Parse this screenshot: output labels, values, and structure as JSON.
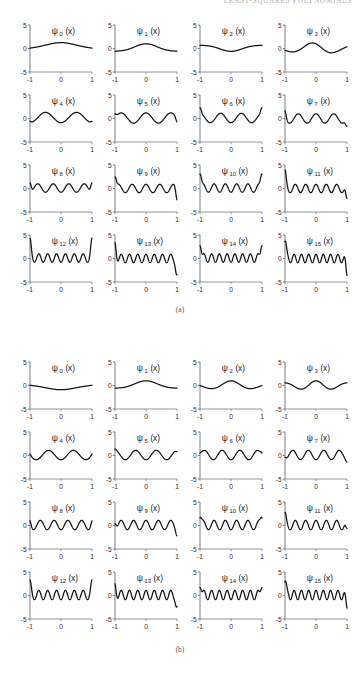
{
  "running_header": {
    "text": "Least-Squares Polynomials"
  },
  "axes": {
    "x_ticks": [
      "-1",
      "0",
      "1"
    ],
    "y_ticks": [
      "5",
      "0",
      "-5"
    ],
    "x_range": [
      -1,
      1
    ],
    "y_range": [
      -5,
      5
    ]
  },
  "figures": [
    {
      "id": "a",
      "caption": "(a)",
      "panel_labels": [
        "ψ",
        "ψ",
        "ψ",
        "ψ",
        "ψ",
        "ψ",
        "ψ",
        "ψ",
        "ψ",
        "ψ",
        "ψ",
        "ψ",
        "ψ",
        "ψ",
        "ψ",
        "ψ"
      ],
      "panels": [
        {
          "label_base": "ψ",
          "label_sub": "0",
          "label_arg": "(x)"
        },
        {
          "label_base": "ψ",
          "label_sub": "1",
          "label_arg": "(x)"
        },
        {
          "label_base": "ψ",
          "label_sub": "2",
          "label_arg": "(x)"
        },
        {
          "label_base": "ψ",
          "label_sub": "3",
          "label_arg": "(x)"
        },
        {
          "label_base": "ψ",
          "label_sub": "4",
          "label_arg": "(x)"
        },
        {
          "label_base": "ψ",
          "label_sub": "5",
          "label_arg": "(x)"
        },
        {
          "label_base": "ψ",
          "label_sub": "6",
          "label_arg": "(x)"
        },
        {
          "label_base": "ψ",
          "label_sub": "7",
          "label_arg": "(x)"
        },
        {
          "label_base": "ψ",
          "label_sub": "8",
          "label_arg": "(x)"
        },
        {
          "label_base": "ψ",
          "label_sub": "9",
          "label_arg": "(x)"
        },
        {
          "label_base": "ψ",
          "label_sub": "10",
          "label_arg": "(x)"
        },
        {
          "label_base": "ψ",
          "label_sub": "11",
          "label_arg": "(x)"
        },
        {
          "label_base": "ψ",
          "label_sub": "12",
          "label_arg": "(x)"
        },
        {
          "label_base": "ψ",
          "label_sub": "13",
          "label_arg": "(x)"
        },
        {
          "label_base": "ψ",
          "label_sub": "14",
          "label_arg": "(x)"
        },
        {
          "label_base": "ψ",
          "label_sub": "15",
          "label_arg": "(x)"
        }
      ]
    },
    {
      "id": "b",
      "caption": "(b)",
      "panels": [
        {
          "label_base": "ψ",
          "label_sub": "0",
          "label_arg": "(x)"
        },
        {
          "label_base": "ψ",
          "label_sub": "1",
          "label_arg": "(x)"
        },
        {
          "label_base": "ψ",
          "label_sub": "2",
          "label_arg": "(x)"
        },
        {
          "label_base": "ψ",
          "label_sub": "3",
          "label_arg": "(x)"
        },
        {
          "label_base": "ψ",
          "label_sub": "4",
          "label_arg": "(x)"
        },
        {
          "label_base": "ψ",
          "label_sub": "5",
          "label_arg": "(x)"
        },
        {
          "label_base": "ψ",
          "label_sub": "6",
          "label_arg": "(x)"
        },
        {
          "label_base": "ψ",
          "label_sub": "7",
          "label_arg": "(x)"
        },
        {
          "label_base": "ψ",
          "label_sub": "8",
          "label_arg": "(x)"
        },
        {
          "label_base": "ψ",
          "label_sub": "9",
          "label_arg": "(x)"
        },
        {
          "label_base": "ψ",
          "label_sub": "10",
          "label_arg": "(x)"
        },
        {
          "label_base": "ψ",
          "label_sub": "11",
          "label_arg": "(x)"
        },
        {
          "label_base": "ψ",
          "label_sub": "12",
          "label_arg": "(x)"
        },
        {
          "label_base": "ψ",
          "label_sub": "13",
          "label_arg": "(x)"
        },
        {
          "label_base": "ψ",
          "label_sub": "14",
          "label_arg": "(x)"
        },
        {
          "label_base": "ψ",
          "label_sub": "15",
          "label_arg": "(x)"
        }
      ]
    }
  ],
  "chart_data": {
    "type": "line",
    "title": "",
    "xlabel": "x",
    "ylabel": "",
    "xlim": [
      -1,
      1
    ],
    "ylim": [
      -5,
      5
    ],
    "grid": false,
    "legend": "none",
    "xticks": [
      -1,
      0,
      1
    ],
    "yticks": [
      -5,
      0,
      5
    ],
    "panel_count_per_figure": 16,
    "layout": "4 columns x 4 rows",
    "note": "Each subplot plots one basis function psi_n(x) over x in [-1,1]; amplitude stays within about -3 to 3, with boundary spikes growing for larger n in panel set (a).",
    "figures": [
      {
        "id": "a",
        "caption": "(a)",
        "family": "boundary-peaked basis (Chebyshev-like) - amplitude concentrates near x = +/-1 as n grows",
        "series": [
          {
            "name": "psi_0",
            "n": 0,
            "freq": 0.5,
            "amp": 1.1,
            "phase": 0.0,
            "edge_spike": 0.0,
            "env": "flat",
            "baseline": 0.15
          },
          {
            "name": "psi_1",
            "n": 1,
            "freq": 1.0,
            "amp": 1.0,
            "phase": 0.0,
            "edge_spike": 0.0,
            "env": "flat",
            "baseline": 0.0
          },
          {
            "name": "psi_2",
            "n": 2,
            "freq": 1.0,
            "amp": 0.9,
            "phase": 3.14,
            "edge_spike": 0.0,
            "env": "flat",
            "baseline": 0.3
          },
          {
            "name": "psi_3",
            "n": 3,
            "freq": 1.5,
            "amp": 1.2,
            "phase": 0.6,
            "edge_spike": 0.0,
            "env": "flat",
            "baseline": 0.0
          },
          {
            "name": "psi_4",
            "n": 4,
            "freq": 2.0,
            "amp": 1.1,
            "phase": 3.14,
            "edge_spike": 0.3,
            "env": "flat",
            "baseline": 0.2
          },
          {
            "name": "psi_5",
            "n": 5,
            "freq": 2.5,
            "amp": 1.1,
            "phase": 0.0,
            "edge_spike": 0.8,
            "env": "flat",
            "baseline": 0.1
          },
          {
            "name": "psi_6",
            "n": 6,
            "freq": 3.0,
            "amp": 1.0,
            "phase": 3.14,
            "edge_spike": 1.2,
            "env": "flat",
            "baseline": 0.1
          },
          {
            "name": "psi_7",
            "n": 7,
            "freq": 3.5,
            "amp": 1.0,
            "phase": 0.0,
            "edge_spike": 1.6,
            "env": "flat",
            "baseline": 0.0
          },
          {
            "name": "psi_8",
            "n": 8,
            "freq": 4.0,
            "amp": 0.9,
            "phase": 3.14,
            "edge_spike": 2.0,
            "env": "flat",
            "baseline": 0.1
          },
          {
            "name": "psi_9",
            "n": 9,
            "freq": 4.5,
            "amp": 0.9,
            "phase": 0.0,
            "edge_spike": 2.4,
            "env": "flat",
            "baseline": 0.0
          },
          {
            "name": "psi_10",
            "n": 10,
            "freq": 5.5,
            "amp": 0.9,
            "phase": 3.14,
            "edge_spike": 2.9,
            "env": "flat",
            "baseline": 0.1
          },
          {
            "name": "psi_11",
            "n": 11,
            "freq": 6.0,
            "amp": 0.9,
            "phase": 0.0,
            "edge_spike": 3.0,
            "env": "flat",
            "baseline": 0.0
          },
          {
            "name": "psi_12",
            "n": 12,
            "freq": 7.0,
            "amp": 0.9,
            "phase": 3.14,
            "edge_spike": 3.3,
            "env": "flat",
            "baseline": 0.1
          },
          {
            "name": "psi_13",
            "n": 13,
            "freq": 7.5,
            "amp": 0.9,
            "phase": 0.0,
            "edge_spike": 3.4,
            "env": "flat",
            "baseline": 0.0
          },
          {
            "name": "psi_14",
            "n": 14,
            "freq": 8.0,
            "amp": 0.9,
            "phase": 3.14,
            "edge_spike": 3.5,
            "env": "flat",
            "baseline": 0.1
          },
          {
            "name": "psi_15",
            "n": 15,
            "freq": 8.5,
            "amp": 0.9,
            "phase": 0.0,
            "edge_spike": 3.6,
            "env": "flat",
            "baseline": 0.0
          }
        ]
      },
      {
        "id": "b",
        "caption": "(b)",
        "family": "uniformly oscillatory basis (Legendre-like) - near-constant amplitude across the interval",
        "series": [
          {
            "name": "psi_0",
            "n": 0,
            "freq": 0.5,
            "amp": 1.0,
            "phase": 3.14,
            "edge_spike": 0.0,
            "env": "flat",
            "baseline": 0.1
          },
          {
            "name": "psi_1",
            "n": 1,
            "freq": 1.0,
            "amp": 1.0,
            "phase": 0.0,
            "edge_spike": 0.0,
            "env": "flat",
            "baseline": 0.0
          },
          {
            "name": "psi_2",
            "n": 2,
            "freq": 1.5,
            "amp": 1.0,
            "phase": 0.0,
            "edge_spike": 0.0,
            "env": "flat",
            "baseline": 0.0
          },
          {
            "name": "psi_3",
            "n": 3,
            "freq": 2.0,
            "amp": 1.0,
            "phase": 0.0,
            "edge_spike": 0.0,
            "env": "flat",
            "baseline": 0.0
          },
          {
            "name": "psi_4",
            "n": 4,
            "freq": 2.5,
            "amp": 1.0,
            "phase": 3.14,
            "edge_spike": 0.2,
            "env": "flat",
            "baseline": 0.1
          },
          {
            "name": "psi_5",
            "n": 5,
            "freq": 3.0,
            "amp": 1.0,
            "phase": 3.14,
            "edge_spike": 0.3,
            "env": "flat",
            "baseline": 0.1
          },
          {
            "name": "psi_6",
            "n": 6,
            "freq": 3.5,
            "amp": 1.0,
            "phase": 3.14,
            "edge_spike": 0.4,
            "env": "flat",
            "baseline": 0.1
          },
          {
            "name": "psi_7",
            "n": 7,
            "freq": 4.0,
            "amp": 1.0,
            "phase": 3.14,
            "edge_spike": 0.5,
            "env": "flat",
            "baseline": 0.1
          },
          {
            "name": "psi_8",
            "n": 8,
            "freq": 4.5,
            "amp": 1.0,
            "phase": 3.14,
            "edge_spike": 0.9,
            "env": "flat",
            "baseline": 0.1
          },
          {
            "name": "psi_9",
            "n": 9,
            "freq": 5.0,
            "amp": 1.0,
            "phase": 0.0,
            "edge_spike": 1.3,
            "env": "flat",
            "baseline": 0.1
          },
          {
            "name": "psi_10",
            "n": 10,
            "freq": 5.5,
            "amp": 1.0,
            "phase": 3.14,
            "edge_spike": 1.5,
            "env": "flat",
            "baseline": 0.1
          },
          {
            "name": "psi_11",
            "n": 11,
            "freq": 6.0,
            "amp": 1.0,
            "phase": 0.0,
            "edge_spike": 1.7,
            "env": "flat",
            "baseline": 0.1
          },
          {
            "name": "psi_12",
            "n": 12,
            "freq": 7.0,
            "amp": 1.0,
            "phase": 3.14,
            "edge_spike": 2.2,
            "env": "flat",
            "baseline": 0.1
          },
          {
            "name": "psi_13",
            "n": 13,
            "freq": 7.5,
            "amp": 1.0,
            "phase": 0.0,
            "edge_spike": 2.4,
            "env": "flat",
            "baseline": 0.1
          },
          {
            "name": "psi_14",
            "n": 14,
            "freq": 8.0,
            "amp": 1.0,
            "phase": 3.14,
            "edge_spike": 2.6,
            "env": "flat",
            "baseline": 0.1
          },
          {
            "name": "psi_15",
            "n": 15,
            "freq": 8.5,
            "amp": 1.0,
            "phase": 0.0,
            "edge_spike": 2.8,
            "env": "flat",
            "baseline": 0.1
          }
        ]
      }
    ]
  }
}
